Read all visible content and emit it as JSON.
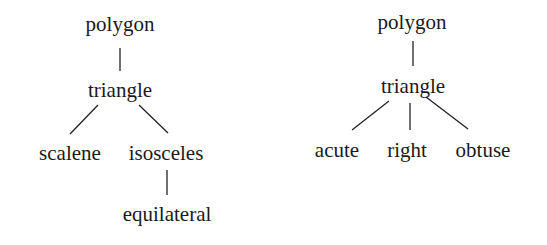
{
  "trees": [
    {
      "name": "left-tree",
      "root": "polygon",
      "child": "triangle",
      "grandchildren": [
        "scalene",
        "isosceles"
      ],
      "great_grandchild": "equilateral"
    },
    {
      "name": "right-tree",
      "root": "polygon",
      "child": "triangle",
      "grandchildren": [
        "acute",
        "right",
        "obtuse"
      ]
    }
  ]
}
